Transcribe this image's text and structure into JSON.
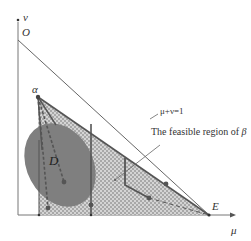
{
  "diagram": {
    "axes": {
      "x_label": "μ",
      "y_label": "v",
      "origin_label": "O"
    },
    "points": {
      "alpha": "α",
      "E": "E",
      "D": "D"
    },
    "line_label": "μ+ν=1",
    "annotation": {
      "text": "The feasible region of",
      "symbol": "β"
    },
    "colors": {
      "region_fill": "#bdbdbd",
      "region_hatch": "#d9d9d9",
      "ellipse": "#7a7a7a",
      "path": "#555555",
      "axis": "#555555"
    }
  }
}
